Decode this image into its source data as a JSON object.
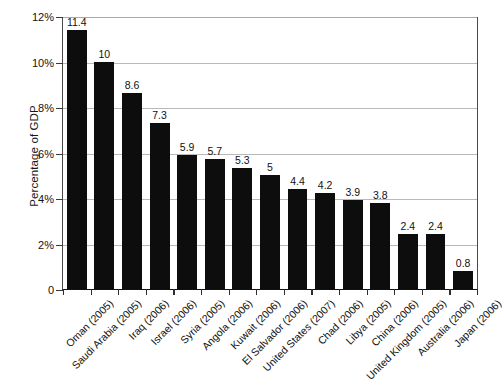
{
  "chart_data": {
    "type": "bar",
    "title": "",
    "xlabel": "",
    "ylabel": "Percentage of GDP",
    "ylim": [
      0,
      12
    ],
    "ytick_labels": [
      "0",
      "2%",
      "4%",
      "6%",
      "8%",
      "10%",
      "12%"
    ],
    "ytick_values": [
      0,
      2,
      4,
      6,
      8,
      10,
      12
    ],
    "grid": true,
    "legend": "none",
    "bar_color": "#0d0d0d",
    "gridline_color": "#b9b9b9",
    "background_color": "#ffffff",
    "categories": [
      "Oman (2005)",
      "Saudi Arabia (2005)",
      "Iraq (2006)",
      "Israel (2006)",
      "Syria (2005)",
      "Angola (2006)",
      "Kuwait (2006)",
      "El Salvador (2006)",
      "United States (2007)",
      "Chad (2006)",
      "Libya (2005)",
      "China (2006)",
      "United Kingdom (2005)",
      "Australia (2006)",
      "Japan (2006)"
    ],
    "values": [
      11.4,
      10,
      8.6,
      7.3,
      5.9,
      5.7,
      5.3,
      5,
      4.4,
      4.2,
      3.9,
      3.8,
      2.4,
      2.4,
      0.8
    ],
    "value_labels": [
      "11.4",
      "10",
      "8.6",
      "7.3",
      "5.9",
      "5.7",
      "5.3",
      "5",
      "4.4",
      "4.2",
      "3.9",
      "3.8",
      "2.4",
      "2.4",
      "0.8"
    ]
  }
}
